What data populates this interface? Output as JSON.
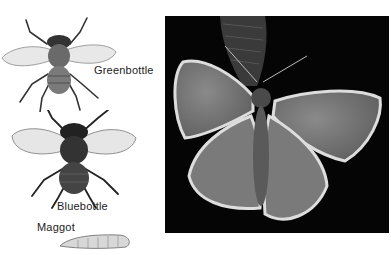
{
  "figure": {
    "illustrations": [
      {
        "name": "greenbottle",
        "label": "Greenbottle"
      },
      {
        "name": "bluebottle",
        "label": "Bluebottle"
      },
      {
        "name": "maggot",
        "label": "Maggot"
      }
    ],
    "photo": {
      "subject": "butterfly",
      "style": "grayscale"
    }
  }
}
